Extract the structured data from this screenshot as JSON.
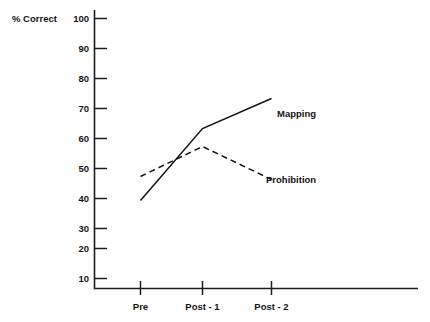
{
  "chart_data": {
    "type": "line",
    "title": "",
    "xlabel": "",
    "ylabel": "% Correct",
    "categories": [
      "Pre",
      "Post - 1",
      "Post - 2"
    ],
    "ylim": [
      0,
      100
    ],
    "ytick_labels": [
      "10",
      "20",
      "30",
      "40",
      "50",
      "60",
      "70",
      "80",
      "90",
      "100"
    ],
    "ytick_values": [
      10,
      20,
      30,
      40,
      50,
      60,
      70,
      80,
      90,
      100
    ],
    "grid": false,
    "legend_position": "inline-right-of-line-ends",
    "series": [
      {
        "name": "Mapping",
        "style": "solid",
        "color": "#141414",
        "values": [
          36,
          60,
          70
        ]
      },
      {
        "name": "Prohibition",
        "style": "dashed",
        "color": "#141414",
        "values": [
          44,
          54,
          43
        ]
      }
    ]
  },
  "axis": {
    "y_axis_title": "% Correct",
    "tick_10": "10",
    "tick_20": "20",
    "tick_30": "30",
    "tick_40": "40",
    "tick_50": "50",
    "tick_60": "60",
    "tick_70": "70",
    "tick_80": "80",
    "tick_90": "90",
    "tick_100": "100",
    "cat_pre": "Pre",
    "cat_post1": "Post - 1",
    "cat_post2": "Post - 2"
  },
  "legend": {
    "mapping_label": "Mapping",
    "prohibition_label": "Prohibition"
  }
}
